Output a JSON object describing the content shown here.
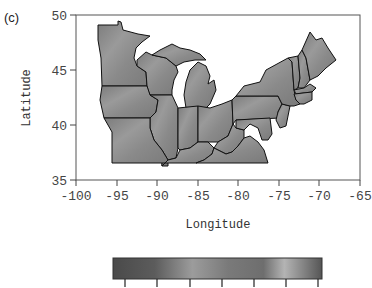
{
  "panel_label": "(c)",
  "map": {
    "region": "US Midwest and Northeast states",
    "xlabel": "Longitude",
    "ylabel": "Latitude",
    "x_ticks": [
      "-100",
      "-95",
      "-90",
      "-85",
      "-80",
      "-75",
      "-70",
      "-65"
    ],
    "y_ticks": [
      "50",
      "45",
      "40",
      "35"
    ],
    "xlim": [
      -100,
      -65
    ],
    "ylim": [
      35,
      50
    ],
    "fill_color": "#8a8a8a",
    "border_color": "#111111"
  },
  "colorbar": {
    "tick_count": 7,
    "tick_labels": [],
    "gradient": [
      "#4a4a4a",
      "#5e5e5e",
      "#9a9a9a",
      "#7a7a7a",
      "#6c6c6c",
      "#b0b0b0",
      "#5a5a5a"
    ]
  }
}
